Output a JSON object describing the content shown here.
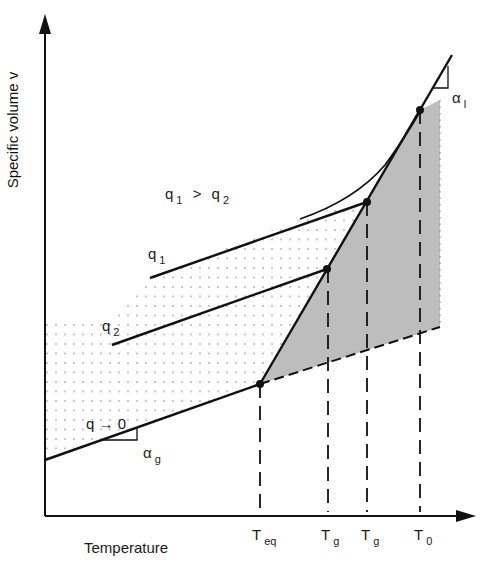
{
  "diagram": {
    "axes": {
      "y_label": "Specific volume v",
      "x_label": "Temperature"
    },
    "annotations": {
      "rate_relation": {
        "q1": "q",
        "s1": "1",
        "gt": ">",
        "q2": "q",
        "s2": "2"
      },
      "q1_label": {
        "base": "q",
        "sub": "1"
      },
      "q2_label": {
        "base": "q",
        "sub": "2"
      },
      "q0_label": {
        "base": "q",
        "arrow": "→",
        "zero": "0"
      },
      "alpha_g": {
        "base": "α",
        "sub": "g"
      },
      "alpha_l": {
        "base": "α",
        "sub": "l"
      }
    },
    "x_ticks": [
      {
        "base": "T",
        "sub": "eq"
      },
      {
        "base": "T",
        "sub": "g"
      },
      {
        "base": "T",
        "sub": "g"
      },
      {
        "base": "T",
        "sub": "0"
      }
    ],
    "colors": {
      "line": "#111111",
      "shade": "#bdbdbd",
      "dots": "#8a8a8a"
    }
  }
}
